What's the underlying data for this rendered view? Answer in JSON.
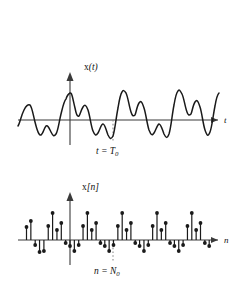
{
  "figure": {
    "title": "",
    "background_color": "#ffffff",
    "ink_color": "#1a1a1a",
    "axis_color": "#3a3a3a",
    "guide_color": "#8a8a8a"
  },
  "top_plot": {
    "name": "continuous-time-signal",
    "y_axis_label": "x(t)",
    "y_axis_label_func": "x",
    "y_axis_label_arg": "(t)",
    "x_axis_label": "t",
    "period_marker_label": "t = T",
    "period_marker_sub": "0",
    "origin_x": 70,
    "baseline_y": 120,
    "marker_x": 113
  },
  "bottom_plot": {
    "name": "discrete-time-signal",
    "y_axis_label": "x[n]",
    "y_axis_label_func": "x",
    "y_axis_label_arg": "[n]",
    "x_axis_label": "n",
    "period_marker_label": "n = N",
    "period_marker_sub": "0",
    "origin_x": 70,
    "baseline_y": 240,
    "marker_x": 113
  },
  "chart_data": [
    {
      "type": "line",
      "name": "x(t) continuous periodic waveform",
      "title": "",
      "xlabel": "t",
      "ylabel": "x(t)",
      "grid": false,
      "legend": null,
      "period_label": "t = T0",
      "period_x_pixel": 113,
      "annotations": [
        "x(t)",
        "t",
        "t = T0"
      ],
      "x": [
        18,
        22,
        26,
        30,
        34,
        38,
        42,
        46,
        50,
        54,
        58,
        62,
        66,
        70,
        74,
        78,
        82,
        86,
        90,
        94,
        98,
        102,
        106,
        110,
        113,
        116,
        120,
        124,
        128,
        132,
        136,
        140,
        144,
        148,
        152,
        156,
        160,
        164,
        168,
        172,
        176,
        180,
        184,
        188,
        192,
        196,
        200,
        204,
        207
      ],
      "values": [
        -6,
        2,
        12,
        8,
        -4,
        -14,
        -6,
        -14,
        -3,
        6,
        2,
        28,
        6,
        18,
        2,
        -10,
        -2,
        -12,
        -4,
        8,
        4,
        30,
        8,
        20,
        12,
        3,
        -10,
        -2,
        -12,
        -4,
        8,
        4,
        30,
        8,
        20,
        4,
        -10,
        -2,
        -12,
        -4,
        8,
        4,
        30,
        8,
        20,
        3,
        -8,
        -2,
        0
      ]
    },
    {
      "type": "stem",
      "name": "x[n] discrete periodic sequence",
      "title": "",
      "xlabel": "n",
      "ylabel": "x[n]",
      "grid": false,
      "legend": null,
      "period_label": "n = N0",
      "period_x_pixel": 113,
      "annotations": [
        "x[n]",
        "n",
        "n = N0"
      ],
      "n": [
        -10,
        -9,
        -8,
        -7,
        -6,
        -5,
        -4,
        -3,
        -2,
        -1,
        0,
        1,
        2,
        3,
        4,
        5,
        6,
        7,
        8,
        9,
        10,
        11,
        12,
        13,
        14,
        15,
        16,
        17,
        18,
        19,
        20,
        21,
        22,
        23,
        24,
        25,
        26,
        27,
        28,
        29,
        30,
        31,
        32
      ],
      "values": [
        13,
        19,
        -5,
        -12,
        -11,
        14,
        27,
        10,
        17,
        -3,
        -6,
        -11,
        -5,
        14,
        27,
        10,
        17,
        -3,
        -6,
        -11,
        -5,
        14,
        27,
        10,
        17,
        -3,
        -6,
        -11,
        -5,
        14,
        27,
        10,
        17,
        -3,
        -6,
        -11,
        -5,
        14,
        27,
        10,
        17,
        -3,
        -6
      ]
    }
  ]
}
